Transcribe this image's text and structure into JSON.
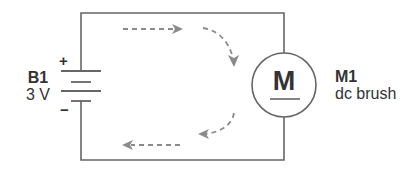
{
  "diagram": {
    "type": "circuit-schematic",
    "colors": {
      "wire": "#666666",
      "current_arrow": "#8a8a8a",
      "text": "#333333",
      "background": "#ffffff"
    },
    "battery": {
      "name": "B1",
      "value": "3 V",
      "positive_sign": "+",
      "negative_sign": "−"
    },
    "motor": {
      "symbol": "M",
      "name": "M1",
      "type": "dc brush"
    },
    "current_flow": {
      "direction": "clockwise",
      "arrow_style": "dashed"
    }
  }
}
